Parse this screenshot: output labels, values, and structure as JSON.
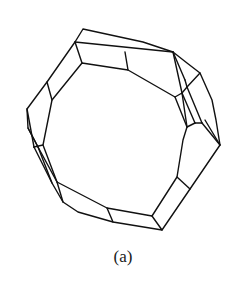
{
  "figure": {
    "caption": "(a)",
    "stroke_color": "#111111",
    "background": "#ffffff",
    "outer_outline": [
      [
        83,
        29
      ],
      [
        143,
        42
      ],
      [
        173,
        52
      ],
      [
        187,
        63
      ],
      [
        200,
        73
      ],
      [
        212,
        100
      ],
      [
        216,
        120
      ],
      [
        220,
        145
      ],
      [
        190,
        189
      ],
      [
        162,
        230
      ],
      [
        113,
        222
      ],
      [
        78,
        212
      ],
      [
        63,
        202
      ],
      [
        52,
        183
      ],
      [
        38,
        147
      ],
      [
        28,
        128
      ],
      [
        27,
        109
      ],
      [
        47,
        82
      ],
      [
        75,
        42
      ],
      [
        83,
        29
      ]
    ],
    "inner_outline": [
      [
        82,
        63
      ],
      [
        128,
        70
      ],
      [
        175,
        97
      ],
      [
        182,
        93
      ],
      [
        187,
        127
      ],
      [
        183,
        140
      ],
      [
        177,
        177
      ],
      [
        152,
        216
      ],
      [
        107,
        208
      ],
      [
        57,
        182
      ],
      [
        43,
        145
      ],
      [
        52,
        100
      ],
      [
        82,
        63
      ]
    ],
    "edges": [
      [
        [
          75,
          42
        ],
        [
          173,
          52
        ]
      ],
      [
        [
          75,
          42
        ],
        [
          82,
          63
        ]
      ],
      [
        [
          125,
          52
        ],
        [
          128,
          70
        ]
      ],
      [
        [
          173,
          52
        ],
        [
          182,
          93
        ]
      ],
      [
        [
          173,
          52
        ],
        [
          185,
          80
        ]
      ],
      [
        [
          185,
          80
        ],
        [
          187,
          87
        ]
      ],
      [
        [
          187,
          87
        ],
        [
          182,
          93
        ]
      ],
      [
        [
          187,
          87
        ],
        [
          200,
          73
        ]
      ],
      [
        [
          175,
          97
        ],
        [
          187,
          127
        ]
      ],
      [
        [
          182,
          93
        ],
        [
          195,
          123
        ]
      ],
      [
        [
          187,
          87
        ],
        [
          202,
          123
        ]
      ],
      [
        [
          187,
          127
        ],
        [
          195,
          123
        ]
      ],
      [
        [
          195,
          123
        ],
        [
          202,
          123
        ]
      ],
      [
        [
          202,
          123
        ],
        [
          220,
          145
        ]
      ],
      [
        [
          205,
          120
        ],
        [
          220,
          145
        ]
      ],
      [
        [
          177,
          177
        ],
        [
          190,
          189
        ]
      ],
      [
        [
          152,
          216
        ],
        [
          162,
          230
        ]
      ],
      [
        [
          107,
          208
        ],
        [
          113,
          222
        ]
      ],
      [
        [
          57,
          182
        ],
        [
          63,
          202
        ]
      ],
      [
        [
          47,
          82
        ],
        [
          52,
          100
        ]
      ],
      [
        [
          27,
          109
        ],
        [
          34,
          147
        ]
      ],
      [
        [
          34,
          147
        ],
        [
          52,
          183
        ]
      ],
      [
        [
          34,
          147
        ],
        [
          43,
          145
        ]
      ],
      [
        [
          38,
          147
        ],
        [
          57,
          182
        ]
      ],
      [
        [
          28,
          128
        ],
        [
          38,
          147
        ]
      ]
    ]
  }
}
